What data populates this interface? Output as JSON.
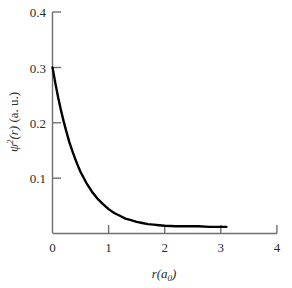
{
  "chart_data": {
    "type": "line",
    "title": "",
    "xlabel": "r(a0)",
    "ylabel": "psi^2(r) (a. u.)",
    "xlim": [
      0,
      4
    ],
    "ylim": [
      0,
      0.4
    ],
    "xticks": [
      0,
      1,
      2,
      3,
      4
    ],
    "yticks": [
      0,
      0.1,
      0.2,
      0.3,
      0.4
    ],
    "xtick_labels": [
      "0",
      "1",
      "2",
      "3",
      "4"
    ],
    "ytick_labels": [
      "0.1",
      "0.2",
      "0.3",
      "0.4"
    ],
    "grid": false,
    "legend": false,
    "series": [
      {
        "name": "psi squared",
        "color": "#000000",
        "x": [
          0.0,
          0.05,
          0.1,
          0.15,
          0.2,
          0.25,
          0.3,
          0.35,
          0.4,
          0.45,
          0.5,
          0.6,
          0.7,
          0.8,
          0.9,
          1.0,
          1.1,
          1.2,
          1.3,
          1.4,
          1.5,
          1.6,
          1.7,
          1.8,
          1.9,
          2.0,
          2.2,
          2.4,
          2.6,
          2.8,
          3.0,
          3.1
        ],
        "values": [
          0.3,
          0.272,
          0.246,
          0.223,
          0.202,
          0.183,
          0.165,
          0.15,
          0.136,
          0.123,
          0.111,
          0.092,
          0.076,
          0.063,
          0.053,
          0.044,
          0.037,
          0.032,
          0.027,
          0.024,
          0.021,
          0.019,
          0.017,
          0.016,
          0.015,
          0.014,
          0.013,
          0.013,
          0.013,
          0.012,
          0.012,
          0.012
        ]
      }
    ]
  },
  "axis_labels": {
    "y_psi": "ψ",
    "y_exp": "2",
    "y_of_r": "(r)",
    "y_units": "(a. u.)",
    "x_r": "r",
    "x_paren_open": "(",
    "x_a": "a",
    "x_sub": "0",
    "x_paren_close": ")"
  },
  "style": {
    "curve_color": "#000000",
    "axis_color": "#6e6e6e",
    "background": "#ffffff",
    "text_color": "#2b2b2b"
  }
}
